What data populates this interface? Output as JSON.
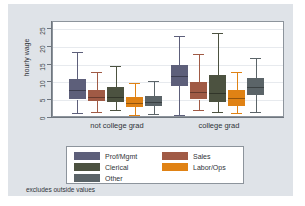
{
  "chart_data": {
    "type": "box",
    "title": "",
    "xlabel": "",
    "ylabel": "hourly wage",
    "ylim": [
      0,
      27
    ],
    "yticks": [
      0,
      5,
      10,
      15,
      20,
      25
    ],
    "grid": true,
    "note": "excludes outside values",
    "legend_position": "bottom",
    "categories": [
      "not college grad",
      "college grad"
    ],
    "series": [
      {
        "name": "Prof/Mgmt",
        "color": "#5d5f7a",
        "boxes": [
          {
            "group": "not college grad",
            "whisker_low": 1.4,
            "q1": 5.2,
            "median": 7.9,
            "q3": 11.0,
            "whisker_high": 18.7
          },
          {
            "group": "college grad",
            "whisker_low": 0.9,
            "q1": 9.1,
            "median": 11.9,
            "q3": 14.9,
            "whisker_high": 23.2
          }
        ]
      },
      {
        "name": "Sales",
        "color": "#a05a45",
        "boxes": [
          {
            "group": "not college grad",
            "whisker_low": 1.6,
            "q1": 4.7,
            "median": 5.9,
            "q3": 7.8,
            "whisker_high": 13.0
          },
          {
            "group": "college grad",
            "whisker_low": 2.3,
            "q1": 5.2,
            "median": 7.4,
            "q3": 10.2,
            "whisker_high": 18.1
          }
        ]
      },
      {
        "name": "Clerical",
        "color": "#4c5240",
        "boxes": [
          {
            "group": "not college grad",
            "whisker_low": 2.3,
            "q1": 4.4,
            "median": 5.9,
            "q3": 8.7,
            "whisker_high": 14.5
          },
          {
            "group": "college grad",
            "whisker_low": 1.7,
            "q1": 4.6,
            "median": 7.1,
            "q3": 12.2,
            "whisker_high": 23.8
          }
        ]
      },
      {
        "name": "Labor/Ops",
        "color": "#e08214",
        "boxes": [
          {
            "group": "not college grad",
            "whisker_low": 0.9,
            "q1": 3.2,
            "median": 4.3,
            "q3": 5.9,
            "whisker_high": 9.9
          },
          {
            "group": "college grad",
            "whisker_low": 1.3,
            "q1": 3.5,
            "median": 5.5,
            "q3": 7.8,
            "whisker_high": 13.0
          }
        ]
      },
      {
        "name": "Other",
        "color": "#5b6468",
        "boxes": [
          {
            "group": "not college grad",
            "whisker_low": 1.1,
            "q1": 3.4,
            "median": 4.6,
            "q3": 6.2,
            "whisker_high": 10.5
          },
          {
            "group": "college grad",
            "whisker_low": 1.8,
            "q1": 6.6,
            "median": 8.6,
            "q3": 11.3,
            "whisker_high": 16.8
          }
        ]
      }
    ]
  },
  "axis": {
    "y_title": "hourly wage",
    "ytick_labels": [
      "0",
      "5",
      "10",
      "15",
      "20",
      "25"
    ],
    "xgroup_labels": [
      "not college grad",
      "college grad"
    ]
  },
  "legend": {
    "entries": [
      {
        "label": "Prof/Mgmt",
        "color": "#5d5f7a"
      },
      {
        "label": "Sales",
        "color": "#a05a45"
      },
      {
        "label": "Clerical",
        "color": "#4c5240"
      },
      {
        "label": "Labor/Ops",
        "color": "#e08214"
      },
      {
        "label": "Other",
        "color": "#5b6468"
      }
    ]
  },
  "footer": {
    "note": "excludes outside values"
  },
  "colors": {
    "figure_background": "#dfe3e8",
    "plot_background": "#ffffff",
    "grid": "#e7eaee",
    "axis": "#6f767e",
    "text": "#2f3338"
  }
}
